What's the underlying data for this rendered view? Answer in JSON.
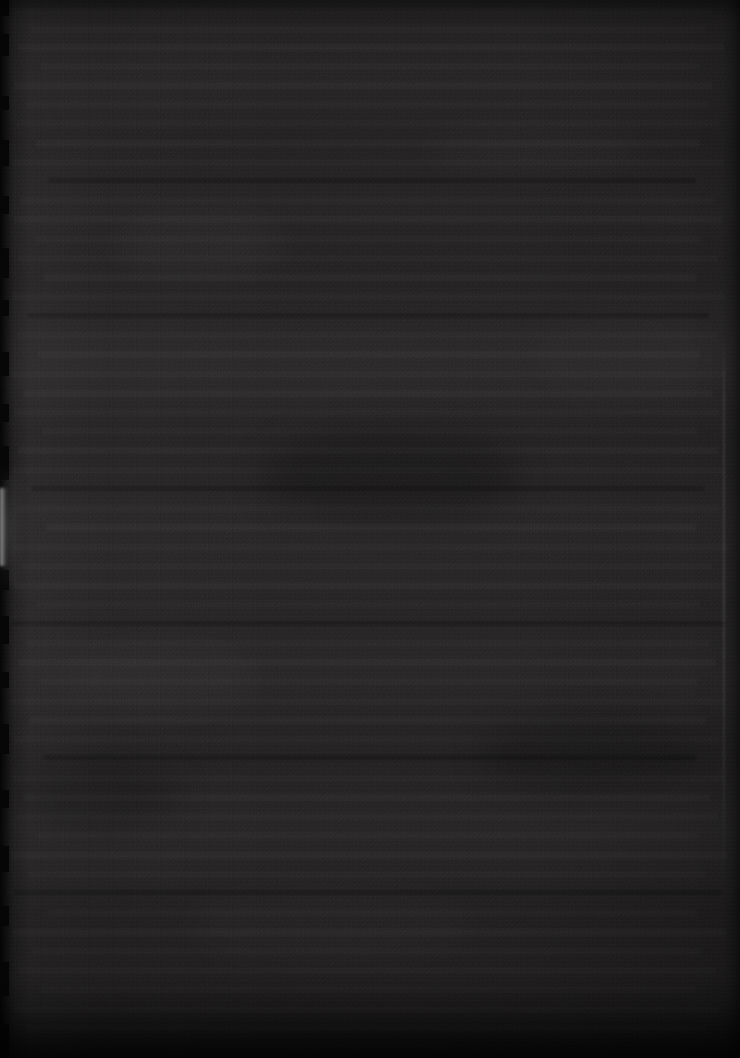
{
  "image": {
    "kind": "photograph",
    "subject": "underexposed-document-page",
    "width": 740,
    "height": 1058,
    "legible_text": "",
    "description_note": "No text is legible; the frame is a near-black, severely underexposed photograph of a printed page."
  },
  "palette": {
    "background": "#222021",
    "paper_dark": "#1d1b1c",
    "paper_light": "#2a2829",
    "edge_shadow": "#070707",
    "edge_glint": "#bebebe",
    "bottom_shadow": "#141314"
  },
  "features": {
    "left_edge": {
      "name": "ragged torn page edge",
      "x": 0,
      "width": 14,
      "notch_count": 18
    },
    "left_glint": {
      "name": "specular highlight sliver on page edge",
      "x": 0,
      "y": 488,
      "width": 9,
      "height": 78,
      "color": "#bebebe"
    },
    "right_seam": {
      "name": "faint page boundary line",
      "x": 723,
      "y": 330,
      "height": 560
    }
  },
  "text_lines": [
    {
      "top": 8,
      "left": 12,
      "width": 700,
      "tone": "dim"
    },
    {
      "top": 26,
      "left": 30,
      "width": 676,
      "tone": "dim"
    },
    {
      "top": 44,
      "left": 18,
      "width": 706,
      "tone": "norm"
    },
    {
      "top": 63,
      "left": 40,
      "width": 660,
      "tone": "dim"
    },
    {
      "top": 82,
      "left": 14,
      "width": 698,
      "tone": "norm"
    },
    {
      "top": 101,
      "left": 26,
      "width": 684,
      "tone": "dim"
    },
    {
      "top": 120,
      "left": 16,
      "width": 704,
      "tone": "dim"
    },
    {
      "top": 140,
      "left": 36,
      "width": 664,
      "tone": "norm"
    },
    {
      "top": 159,
      "left": 12,
      "width": 712,
      "tone": "dim"
    },
    {
      "top": 178,
      "left": 48,
      "width": 648,
      "tone": "dark"
    },
    {
      "top": 197,
      "left": 20,
      "width": 694,
      "tone": "dim"
    },
    {
      "top": 216,
      "left": 14,
      "width": 708,
      "tone": "norm"
    },
    {
      "top": 236,
      "left": 34,
      "width": 668,
      "tone": "dim"
    },
    {
      "top": 255,
      "left": 18,
      "width": 700,
      "tone": "dim"
    },
    {
      "top": 274,
      "left": 44,
      "width": 652,
      "tone": "norm"
    },
    {
      "top": 293,
      "left": 12,
      "width": 714,
      "tone": "dim"
    },
    {
      "top": 313,
      "left": 28,
      "width": 680,
      "tone": "dark"
    },
    {
      "top": 332,
      "left": 16,
      "width": 702,
      "tone": "dim"
    },
    {
      "top": 351,
      "left": 38,
      "width": 662,
      "tone": "norm"
    },
    {
      "top": 371,
      "left": 10,
      "width": 716,
      "tone": "dim"
    },
    {
      "top": 390,
      "left": 24,
      "width": 688,
      "tone": "norm"
    },
    {
      "top": 409,
      "left": 14,
      "width": 706,
      "tone": "dim"
    },
    {
      "top": 428,
      "left": 42,
      "width": 656,
      "tone": "dim"
    },
    {
      "top": 447,
      "left": 18,
      "width": 700,
      "tone": "norm"
    },
    {
      "top": 467,
      "left": 12,
      "width": 712,
      "tone": "dim"
    },
    {
      "top": 486,
      "left": 32,
      "width": 672,
      "tone": "dark"
    },
    {
      "top": 505,
      "left": 16,
      "width": 704,
      "tone": "dim"
    },
    {
      "top": 524,
      "left": 46,
      "width": 650,
      "tone": "norm"
    },
    {
      "top": 544,
      "left": 10,
      "width": 718,
      "tone": "dim"
    },
    {
      "top": 563,
      "left": 22,
      "width": 690,
      "tone": "dim"
    },
    {
      "top": 582,
      "left": 14,
      "width": 708,
      "tone": "norm"
    },
    {
      "top": 601,
      "left": 36,
      "width": 664,
      "tone": "dim"
    },
    {
      "top": 621,
      "left": 12,
      "width": 714,
      "tone": "dark"
    },
    {
      "top": 640,
      "left": 26,
      "width": 684,
      "tone": "dim"
    },
    {
      "top": 659,
      "left": 18,
      "width": 698,
      "tone": "norm"
    },
    {
      "top": 678,
      "left": 40,
      "width": 658,
      "tone": "dim"
    },
    {
      "top": 698,
      "left": 10,
      "width": 716,
      "tone": "dim"
    },
    {
      "top": 717,
      "left": 30,
      "width": 676,
      "tone": "norm"
    },
    {
      "top": 736,
      "left": 14,
      "width": 706,
      "tone": "dim"
    },
    {
      "top": 755,
      "left": 44,
      "width": 652,
      "tone": "dark"
    },
    {
      "top": 775,
      "left": 12,
      "width": 712,
      "tone": "dim"
    },
    {
      "top": 794,
      "left": 24,
      "width": 686,
      "tone": "norm"
    },
    {
      "top": 813,
      "left": 16,
      "width": 702,
      "tone": "dim"
    },
    {
      "top": 832,
      "left": 38,
      "width": 660,
      "tone": "dim"
    },
    {
      "top": 852,
      "left": 10,
      "width": 718,
      "tone": "norm"
    },
    {
      "top": 871,
      "left": 28,
      "width": 678,
      "tone": "dim"
    },
    {
      "top": 890,
      "left": 14,
      "width": 708,
      "tone": "dark"
    },
    {
      "top": 909,
      "left": 48,
      "width": 648,
      "tone": "dim"
    },
    {
      "top": 929,
      "left": 12,
      "width": 714,
      "tone": "norm"
    },
    {
      "top": 948,
      "left": 32,
      "width": 670,
      "tone": "dim"
    },
    {
      "top": 967,
      "left": 18,
      "width": 698,
      "tone": "dim"
    },
    {
      "top": 986,
      "left": 40,
      "width": 656,
      "tone": "dim"
    },
    {
      "top": 1006,
      "left": 14,
      "width": 704,
      "tone": "dim"
    },
    {
      "top": 1025,
      "left": 26,
      "width": 680,
      "tone": "dim"
    }
  ],
  "edge_notches": [
    {
      "top": 0,
      "height": 16
    },
    {
      "top": 34,
      "height": 22
    },
    {
      "top": 96,
      "height": 14
    },
    {
      "top": 140,
      "height": 26
    },
    {
      "top": 196,
      "height": 18
    },
    {
      "top": 248,
      "height": 30
    },
    {
      "top": 300,
      "height": 16
    },
    {
      "top": 352,
      "height": 24
    },
    {
      "top": 404,
      "height": 18
    },
    {
      "top": 446,
      "height": 34
    },
    {
      "top": 570,
      "height": 20
    },
    {
      "top": 616,
      "height": 28
    },
    {
      "top": 672,
      "height": 16
    },
    {
      "top": 724,
      "height": 30
    },
    {
      "top": 790,
      "height": 18
    },
    {
      "top": 846,
      "height": 26
    },
    {
      "top": 906,
      "height": 20
    },
    {
      "top": 962,
      "height": 34
    },
    {
      "top": 1024,
      "height": 34
    }
  ],
  "blotches": [
    {
      "left": 110,
      "top": 210,
      "w": 180,
      "h": 70,
      "color": "rgba(255,255,255,0.022)"
    },
    {
      "left": 420,
      "top": 120,
      "w": 220,
      "h": 60,
      "color": "rgba(255,255,255,0.018)"
    },
    {
      "left": 260,
      "top": 430,
      "w": 260,
      "h": 90,
      "color": "rgba(0,0,0,0.22)"
    },
    {
      "left": 60,
      "top": 640,
      "w": 200,
      "h": 80,
      "color": "rgba(255,255,255,0.020)"
    },
    {
      "left": 480,
      "top": 720,
      "w": 230,
      "h": 70,
      "color": "rgba(0,0,0,0.20)"
    },
    {
      "left": 180,
      "top": 880,
      "w": 300,
      "h": 90,
      "color": "rgba(255,255,255,0.016)"
    },
    {
      "left": 530,
      "top": 300,
      "w": 190,
      "h": 110,
      "color": "rgba(255,255,255,0.014)"
    },
    {
      "left": 20,
      "top": 760,
      "w": 160,
      "h": 70,
      "color": "rgba(0,0,0,0.18)"
    }
  ]
}
